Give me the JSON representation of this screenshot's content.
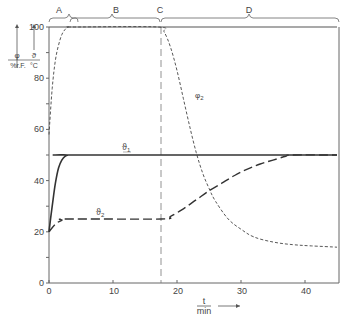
{
  "chart_data": {
    "type": "line",
    "title": "",
    "xlabel": "t / min",
    "ylabel_left": [
      "φ / %r.F.",
      "ϑ / °C"
    ],
    "xlim": [
      0,
      45
    ],
    "ylim": [
      0,
      100
    ],
    "x_ticks": [
      0,
      10,
      20,
      30,
      40
    ],
    "y_ticks": [
      0,
      20,
      40,
      60,
      80,
      100
    ],
    "grid": false,
    "phases": [
      {
        "label": "A",
        "x_start": 0,
        "x_end": 3
      },
      {
        "label": "B",
        "x_start": 3,
        "x_end": 17.5
      },
      {
        "label": "C",
        "x_start": 17.5,
        "x_end": 17.5
      },
      {
        "label": "D",
        "x_start": 17.5,
        "x_end": 45
      }
    ],
    "vertical_marker_x": 17.5,
    "series": [
      {
        "name": "φ1",
        "style": "solid-thin",
        "x": [
          0,
          45
        ],
        "y": [
          100,
          100
        ]
      },
      {
        "name": "φ2",
        "style": "short-dash",
        "x": [
          0,
          0.5,
          1,
          1.5,
          2,
          2.5,
          3,
          4,
          17,
          18,
          19,
          20,
          21,
          22,
          23,
          24,
          25,
          26,
          28,
          30,
          32,
          35,
          38,
          41,
          45
        ],
        "y": [
          58,
          76,
          87,
          93,
          97,
          99,
          100,
          100,
          100,
          98,
          92,
          83,
          72,
          61,
          51,
          43,
          37,
          32,
          25,
          21,
          18,
          16,
          15,
          14.5,
          14
        ]
      },
      {
        "name": "ϑ1",
        "style": "solid",
        "x": [
          0,
          0.5,
          1,
          1.5,
          2,
          2.5,
          3,
          4,
          45
        ],
        "y": [
          20,
          30,
          39,
          45,
          48,
          49.5,
          50,
          50,
          50
        ]
      },
      {
        "name": "ϑ2",
        "style": "long-dash",
        "x": [
          0,
          1,
          2,
          3,
          17.5,
          19,
          21,
          23,
          25,
          27,
          29,
          31,
          33,
          35,
          37,
          38,
          45
        ],
        "y": [
          20,
          23,
          24.5,
          25,
          25,
          26,
          29,
          32.5,
          36,
          39,
          42,
          44.5,
          46.5,
          48,
          49.5,
          50,
          50
        ]
      }
    ],
    "annotations": [
      {
        "text": "ϑ1",
        "x": 12,
        "y": 52
      },
      {
        "text": "ϑ2",
        "x": 11.5,
        "y": 27
      },
      {
        "text": "φ2",
        "x": 23,
        "y": 73
      }
    ]
  },
  "labels": {
    "phase_a": "A",
    "phase_b": "B",
    "phase_c": "C",
    "phase_d": "D",
    "y_unit_phi_top": "φ",
    "y_unit_phi_bottom": "%r.F.",
    "y_unit_theta_top": "ϑ",
    "y_unit_theta_bottom": "°C",
    "x_unit_top": "t",
    "x_unit_bottom": "min",
    "ann_theta1": "ϑ",
    "ann_theta1_sub": "1",
    "ann_theta2": "ϑ",
    "ann_theta2_sub": "2",
    "ann_phi2": "φ",
    "ann_phi2_sub": "2",
    "ytick_0": "0",
    "ytick_20": "20",
    "ytick_40": "40",
    "ytick_60": "60",
    "ytick_80": "80",
    "ytick_100": "100",
    "xtick_0": "0",
    "xtick_10": "10",
    "xtick_20": "20",
    "xtick_30": "30",
    "xtick_40": "40"
  }
}
